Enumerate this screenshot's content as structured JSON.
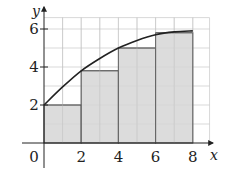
{
  "chart_data": {
    "type": "bar",
    "title": "",
    "xlabel": "x",
    "ylabel": "y",
    "xlim": [
      0,
      8.5
    ],
    "ylim": [
      0,
      6.5
    ],
    "grid": true,
    "x_ticks": [
      "2",
      "4",
      "6",
      "8"
    ],
    "y_ticks": [
      "2",
      "4",
      "6"
    ],
    "origin_label": "0",
    "bars": [
      {
        "x_start": 0,
        "x_end": 2,
        "height": 2.0
      },
      {
        "x_start": 2,
        "x_end": 4,
        "height": 3.8
      },
      {
        "x_start": 4,
        "x_end": 6,
        "height": 5.0
      },
      {
        "x_start": 6,
        "x_end": 8,
        "height": 5.8
      }
    ],
    "curve": {
      "x": [
        0,
        1,
        2,
        3,
        4,
        5,
        6,
        7,
        8
      ],
      "y": [
        2.0,
        2.95,
        3.8,
        4.45,
        5.0,
        5.4,
        5.7,
        5.85,
        5.9
      ]
    },
    "colors": {
      "bar_fill": "#d6d6d6",
      "bar_stroke": "#333333",
      "grid": "#c8c8c8",
      "curve": "#222222",
      "axis": "#222222"
    }
  }
}
